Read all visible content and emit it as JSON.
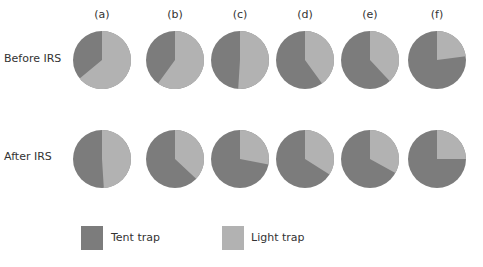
{
  "colors": {
    "tent": "#7c7c7c",
    "light": "#b2b2b2"
  },
  "columns": [
    "(a)",
    "(b)",
    "(c)",
    "(d)",
    "(e)",
    "(f)"
  ],
  "rows": [
    "Before IRS",
    "After IRS"
  ],
  "legend": {
    "tent_label": "Tent trap",
    "light_label": "Light trap"
  },
  "chart_data": {
    "type": "pie",
    "title": "",
    "legend": [
      "Tent trap",
      "Light trap"
    ],
    "legend_position": "bottom",
    "panels": [
      "(a)",
      "(b)",
      "(c)",
      "(d)",
      "(e)",
      "(f)"
    ],
    "series": [
      {
        "name": "Before IRS",
        "tent_trap": [
          36,
          40,
          49,
          60,
          62,
          77
        ],
        "light_trap": [
          64,
          60,
          51,
          40,
          38,
          23
        ]
      },
      {
        "name": "After IRS",
        "tent_trap": [
          51,
          63,
          72,
          66,
          67,
          75
        ],
        "light_trap": [
          49,
          37,
          28,
          34,
          33,
          25
        ]
      }
    ]
  }
}
